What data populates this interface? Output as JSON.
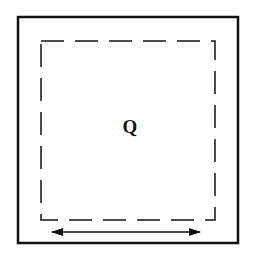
{
  "diagram": {
    "colors": {
      "background": "#ffffff",
      "stroke": "#111111"
    },
    "outer_square": {
      "x": 18,
      "y": 17,
      "width": 220,
      "height": 226,
      "stroke_width": 2.5
    },
    "inner_dashed_square": {
      "x": 41,
      "y": 41,
      "width": 174,
      "height": 179,
      "stroke_width": 1.5,
      "dash": "23 11"
    },
    "region_label": {
      "text": "Q",
      "x": 130,
      "y": 133
    },
    "width_arrow": {
      "x1": 52,
      "x2": 200,
      "y": 232,
      "direction": "double-headed",
      "stroke_width": 1.5
    }
  }
}
